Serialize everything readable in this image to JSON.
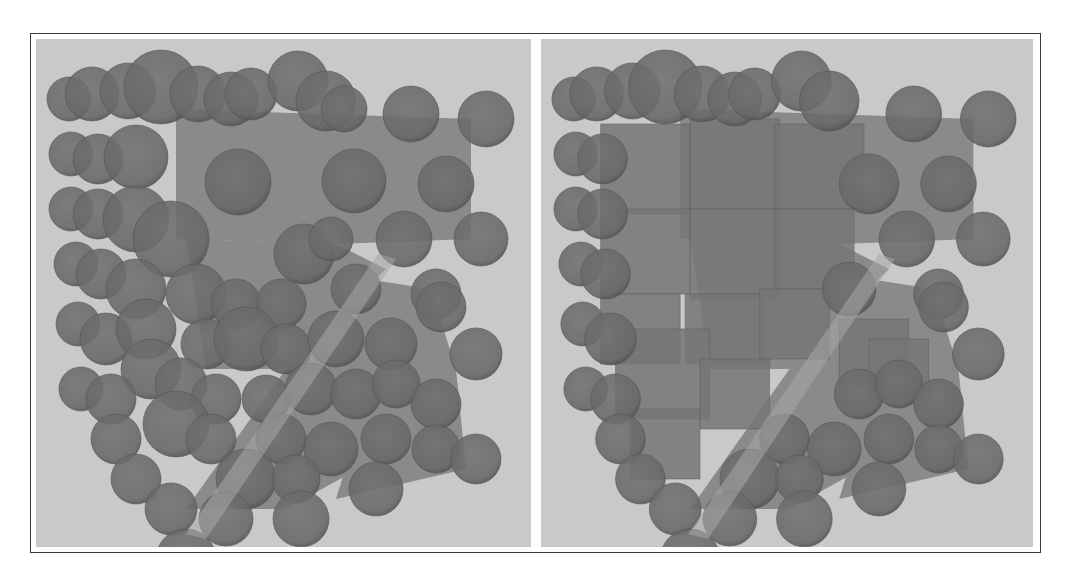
{
  "figure": {
    "panel_count": 2,
    "colors": {
      "background": "#c9c9c9",
      "sphere_fill": "#686868",
      "sphere_edge": "#555555",
      "slab_fill": "#8a8a8a",
      "cube_fill": "#767676",
      "frame": "#3a3a3a"
    },
    "panels": [
      {
        "name": "left",
        "description": "Spheres packed around translucent slabs",
        "slabs": [
          {
            "points": "140,70 435,80 435,200 300,205 140,200"
          },
          {
            "points": "150,200 300,205 350,230 250,330 170,330"
          },
          {
            "points": "330,240 395,250 420,330 340,420 250,470 150,470 250,330"
          },
          {
            "points": "340,330 420,330 430,430 300,460"
          }
        ],
        "diagonal_gap": {
          "points": "342,215 360,220 170,500 150,495"
        },
        "spheres": [
          {
            "cx": 33,
            "cy": 60,
            "r": 22
          },
          {
            "cx": 56,
            "cy": 55,
            "r": 27
          },
          {
            "cx": 92,
            "cy": 52,
            "r": 28
          },
          {
            "cx": 125,
            "cy": 48,
            "r": 37
          },
          {
            "cx": 162,
            "cy": 55,
            "r": 28
          },
          {
            "cx": 195,
            "cy": 60,
            "r": 27
          },
          {
            "cx": 215,
            "cy": 55,
            "r": 26
          },
          {
            "cx": 262,
            "cy": 42,
            "r": 30
          },
          {
            "cx": 290,
            "cy": 62,
            "r": 30
          },
          {
            "cx": 308,
            "cy": 70,
            "r": 23
          },
          {
            "cx": 375,
            "cy": 75,
            "r": 28
          },
          {
            "cx": 450,
            "cy": 80,
            "r": 28
          },
          {
            "cx": 35,
            "cy": 115,
            "r": 22
          },
          {
            "cx": 62,
            "cy": 120,
            "r": 25
          },
          {
            "cx": 100,
            "cy": 118,
            "r": 32
          },
          {
            "cx": 202,
            "cy": 143,
            "r": 33
          },
          {
            "cx": 318,
            "cy": 142,
            "r": 32
          },
          {
            "cx": 410,
            "cy": 145,
            "r": 28
          },
          {
            "cx": 35,
            "cy": 170,
            "r": 22
          },
          {
            "cx": 62,
            "cy": 175,
            "r": 25
          },
          {
            "cx": 100,
            "cy": 180,
            "r": 33
          },
          {
            "cx": 135,
            "cy": 200,
            "r": 38
          },
          {
            "cx": 268,
            "cy": 215,
            "r": 30
          },
          {
            "cx": 295,
            "cy": 200,
            "r": 22
          },
          {
            "cx": 368,
            "cy": 200,
            "r": 28
          },
          {
            "cx": 445,
            "cy": 200,
            "r": 27
          },
          {
            "cx": 40,
            "cy": 225,
            "r": 22
          },
          {
            "cx": 65,
            "cy": 235,
            "r": 25
          },
          {
            "cx": 100,
            "cy": 250,
            "r": 30
          },
          {
            "cx": 160,
            "cy": 255,
            "r": 30
          },
          {
            "cx": 200,
            "cy": 265,
            "r": 25
          },
          {
            "cx": 245,
            "cy": 265,
            "r": 25
          },
          {
            "cx": 320,
            "cy": 250,
            "r": 25
          },
          {
            "cx": 400,
            "cy": 255,
            "r": 25
          },
          {
            "cx": 405,
            "cy": 268,
            "r": 25
          },
          {
            "cx": 42,
            "cy": 285,
            "r": 22
          },
          {
            "cx": 70,
            "cy": 300,
            "r": 26
          },
          {
            "cx": 110,
            "cy": 290,
            "r": 30
          },
          {
            "cx": 115,
            "cy": 330,
            "r": 30
          },
          {
            "cx": 170,
            "cy": 305,
            "r": 25
          },
          {
            "cx": 210,
            "cy": 300,
            "r": 32
          },
          {
            "cx": 250,
            "cy": 310,
            "r": 25
          },
          {
            "cx": 300,
            "cy": 300,
            "r": 28
          },
          {
            "cx": 355,
            "cy": 305,
            "r": 26
          },
          {
            "cx": 440,
            "cy": 315,
            "r": 26
          },
          {
            "cx": 45,
            "cy": 350,
            "r": 22
          },
          {
            "cx": 75,
            "cy": 360,
            "r": 25
          },
          {
            "cx": 145,
            "cy": 345,
            "r": 26
          },
          {
            "cx": 180,
            "cy": 360,
            "r": 25
          },
          {
            "cx": 230,
            "cy": 360,
            "r": 24
          },
          {
            "cx": 275,
            "cy": 350,
            "r": 26
          },
          {
            "cx": 320,
            "cy": 355,
            "r": 25
          },
          {
            "cx": 360,
            "cy": 345,
            "r": 24
          },
          {
            "cx": 400,
            "cy": 365,
            "r": 25
          },
          {
            "cx": 80,
            "cy": 400,
            "r": 25
          },
          {
            "cx": 140,
            "cy": 385,
            "r": 33
          },
          {
            "cx": 175,
            "cy": 400,
            "r": 25
          },
          {
            "cx": 245,
            "cy": 400,
            "r": 25
          },
          {
            "cx": 295,
            "cy": 410,
            "r": 27
          },
          {
            "cx": 350,
            "cy": 400,
            "r": 25
          },
          {
            "cx": 400,
            "cy": 410,
            "r": 24
          },
          {
            "cx": 440,
            "cy": 420,
            "r": 25
          },
          {
            "cx": 100,
            "cy": 440,
            "r": 25
          },
          {
            "cx": 210,
            "cy": 440,
            "r": 30
          },
          {
            "cx": 260,
            "cy": 440,
            "r": 24
          },
          {
            "cx": 340,
            "cy": 450,
            "r": 27
          },
          {
            "cx": 135,
            "cy": 470,
            "r": 26
          },
          {
            "cx": 190,
            "cy": 480,
            "r": 27
          },
          {
            "cx": 265,
            "cy": 480,
            "r": 28
          },
          {
            "cx": 150,
            "cy": 520,
            "r": 30
          }
        ],
        "cubes": []
      },
      {
        "name": "right",
        "description": "Spheres and cubes packed around translucent slabs",
        "slabs": [
          {
            "points": "140,70 435,80 435,200 300,205 140,200"
          },
          {
            "points": "150,200 300,205 350,230 250,330 170,330"
          },
          {
            "points": "330,240 395,250 420,330 340,420 250,470 150,470 250,330"
          },
          {
            "points": "340,330 420,330 430,430 300,460"
          }
        ],
        "diagonal_gap": {
          "points": "340,215 356,220 168,500 148,495"
        },
        "spheres": [
          {
            "cx": 33,
            "cy": 60,
            "r": 22
          },
          {
            "cx": 56,
            "cy": 55,
            "r": 27
          },
          {
            "cx": 92,
            "cy": 52,
            "r": 28
          },
          {
            "cx": 125,
            "cy": 48,
            "r": 37
          },
          {
            "cx": 162,
            "cy": 55,
            "r": 28
          },
          {
            "cx": 195,
            "cy": 60,
            "r": 27
          },
          {
            "cx": 215,
            "cy": 55,
            "r": 26
          },
          {
            "cx": 262,
            "cy": 42,
            "r": 30
          },
          {
            "cx": 290,
            "cy": 62,
            "r": 30
          },
          {
            "cx": 375,
            "cy": 75,
            "r": 28
          },
          {
            "cx": 450,
            "cy": 80,
            "r": 28
          },
          {
            "cx": 35,
            "cy": 115,
            "r": 22
          },
          {
            "cx": 62,
            "cy": 120,
            "r": 25
          },
          {
            "cx": 410,
            "cy": 145,
            "r": 28
          },
          {
            "cx": 35,
            "cy": 170,
            "r": 22
          },
          {
            "cx": 62,
            "cy": 175,
            "r": 25
          },
          {
            "cx": 368,
            "cy": 200,
            "r": 28
          },
          {
            "cx": 445,
            "cy": 200,
            "r": 27
          },
          {
            "cx": 40,
            "cy": 225,
            "r": 22
          },
          {
            "cx": 65,
            "cy": 235,
            "r": 25
          },
          {
            "cx": 400,
            "cy": 255,
            "r": 25
          },
          {
            "cx": 405,
            "cy": 268,
            "r": 25
          },
          {
            "cx": 42,
            "cy": 285,
            "r": 22
          },
          {
            "cx": 70,
            "cy": 300,
            "r": 26
          },
          {
            "cx": 440,
            "cy": 315,
            "r": 26
          },
          {
            "cx": 45,
            "cy": 350,
            "r": 22
          },
          {
            "cx": 75,
            "cy": 360,
            "r": 25
          },
          {
            "cx": 320,
            "cy": 355,
            "r": 25
          },
          {
            "cx": 360,
            "cy": 345,
            "r": 24
          },
          {
            "cx": 400,
            "cy": 365,
            "r": 25
          },
          {
            "cx": 80,
            "cy": 400,
            "r": 25
          },
          {
            "cx": 245,
            "cy": 400,
            "r": 25
          },
          {
            "cx": 295,
            "cy": 410,
            "r": 27
          },
          {
            "cx": 350,
            "cy": 400,
            "r": 25
          },
          {
            "cx": 400,
            "cy": 410,
            "r": 24
          },
          {
            "cx": 440,
            "cy": 420,
            "r": 25
          },
          {
            "cx": 100,
            "cy": 440,
            "r": 25
          },
          {
            "cx": 210,
            "cy": 440,
            "r": 30
          },
          {
            "cx": 260,
            "cy": 440,
            "r": 24
          },
          {
            "cx": 340,
            "cy": 450,
            "r": 27
          },
          {
            "cx": 135,
            "cy": 470,
            "r": 26
          },
          {
            "cx": 190,
            "cy": 480,
            "r": 27
          },
          {
            "cx": 265,
            "cy": 480,
            "r": 28
          },
          {
            "cx": 150,
            "cy": 520,
            "r": 30
          },
          {
            "cx": 310,
            "cy": 250,
            "r": 27
          },
          {
            "cx": 330,
            "cy": 145,
            "r": 30
          }
        ],
        "cubes": [
          {
            "x": 60,
            "y": 85,
            "w": 90,
            "h": 90
          },
          {
            "x": 150,
            "y": 80,
            "w": 90,
            "h": 90
          },
          {
            "x": 235,
            "y": 85,
            "w": 90,
            "h": 85
          },
          {
            "x": 60,
            "y": 170,
            "w": 90,
            "h": 85
          },
          {
            "x": 150,
            "y": 170,
            "w": 90,
            "h": 90
          },
          {
            "x": 235,
            "y": 170,
            "w": 80,
            "h": 80
          },
          {
            "x": 60,
            "y": 255,
            "w": 80,
            "h": 70
          },
          {
            "x": 145,
            "y": 255,
            "w": 80,
            "h": 70
          },
          {
            "x": 220,
            "y": 250,
            "w": 70,
            "h": 70
          },
          {
            "x": 75,
            "y": 290,
            "w": 95,
            "h": 90
          },
          {
            "x": 90,
            "y": 370,
            "w": 70,
            "h": 70
          },
          {
            "x": 160,
            "y": 320,
            "w": 70,
            "h": 70
          },
          {
            "x": 300,
            "y": 280,
            "w": 70,
            "h": 70
          },
          {
            "x": 330,
            "y": 300,
            "w": 60,
            "h": 60
          }
        ]
      }
    ]
  }
}
